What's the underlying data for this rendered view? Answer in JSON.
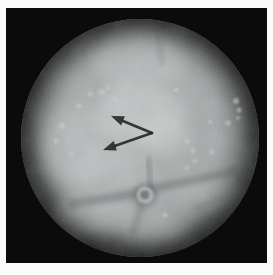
{
  "figure": {
    "colors": {
      "matte": "#fbfbfb",
      "field_background": "#0b0b0b",
      "tissue_base": "#a6aaaa",
      "tissue_bright": "#d2d6d6",
      "fold_shadow": "#4e5252",
      "annotation_arrow": "#232323"
    },
    "annotations": {
      "arrows": [
        {
          "name": "upper-arrow",
          "tail": [
            152,
            133
          ],
          "tip": [
            111,
            116
          ]
        },
        {
          "name": "lower-arrow",
          "tail": [
            152,
            133
          ],
          "tip": [
            103,
            150
          ]
        }
      ],
      "arrow_head_length": 13,
      "arrow_head_half_width": 5,
      "arrow_shaft_width": 2.6
    },
    "landmarks": {
      "orifice": {
        "cx": 145,
        "cy": 195,
        "outer_r": 8,
        "inner_r": 4
      },
      "folds": [
        {
          "x1": 140,
          "y1": 193,
          "x2": 72,
          "y2": 204,
          "w": 9,
          "o": 0.38
        },
        {
          "x1": 152,
          "y1": 189,
          "x2": 236,
          "y2": 171,
          "w": 8,
          "o": 0.38
        },
        {
          "x1": 148,
          "y1": 160,
          "x2": 151,
          "y2": 187,
          "w": 6,
          "o": 0.3
        },
        {
          "x1": 142,
          "y1": 203,
          "x2": 133,
          "y2": 233,
          "w": 7,
          "o": 0.26
        },
        {
          "x1": 158,
          "y1": 36,
          "x2": 162,
          "y2": 62,
          "w": 6,
          "o": 0.16
        },
        {
          "x1": 196,
          "y1": 208,
          "x2": 232,
          "y2": 196,
          "w": 7,
          "o": 0.2
        }
      ],
      "highlights": [
        {
          "cx": 138,
          "cy": 114,
          "rx": 45,
          "ry": 32,
          "o": 0.5
        },
        {
          "cx": 163,
          "cy": 135,
          "rx": 26,
          "ry": 20,
          "o": 0.45
        },
        {
          "cx": 112,
          "cy": 168,
          "rx": 40,
          "ry": 25,
          "o": 0.3
        },
        {
          "cx": 76,
          "cy": 148,
          "rx": 34,
          "ry": 40,
          "o": 0.3
        },
        {
          "cx": 140,
          "cy": 62,
          "rx": 46,
          "ry": 25,
          "o": 0.28
        },
        {
          "cx": 95,
          "cy": 212,
          "rx": 38,
          "ry": 20,
          "o": 0.28
        },
        {
          "cx": 152,
          "cy": 228,
          "rx": 30,
          "ry": 15,
          "o": 0.25
        },
        {
          "cx": 205,
          "cy": 192,
          "rx": 34,
          "ry": 16,
          "o": 0.18
        }
      ],
      "speckles": [
        [
          102,
          92,
          3
        ],
        [
          90,
          94,
          2.5
        ],
        [
          115,
          99,
          2
        ],
        [
          79,
          106,
          2.5
        ],
        [
          108,
          88,
          2
        ],
        [
          62,
          126,
          3
        ],
        [
          56,
          141,
          2.5
        ],
        [
          71,
          154,
          2.5
        ],
        [
          187,
          141,
          2.5
        ],
        [
          193,
          151,
          2.5
        ],
        [
          195,
          161,
          2
        ],
        [
          212,
          152,
          2.5
        ],
        [
          187,
          168,
          2
        ],
        [
          236,
          101,
          3
        ],
        [
          239,
          110,
          2.5
        ],
        [
          238,
          118,
          2
        ],
        [
          228,
          123,
          2.5
        ],
        [
          210,
          122,
          2
        ],
        [
          176,
          90,
          2.5
        ],
        [
          165,
          215,
          2.5
        ]
      ]
    }
  }
}
